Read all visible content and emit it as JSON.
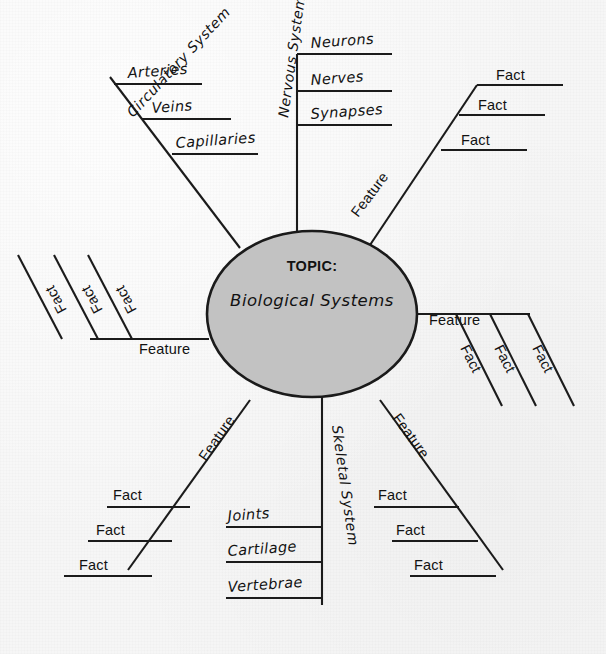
{
  "diagram": {
    "type": "mind-map",
    "title_label": "TOPIC:",
    "topic": "Biological Systems",
    "colors": {
      "background": "#f6f6f6",
      "center_fill": "#c2c2c2",
      "stroke": "#1b1b1b",
      "text": "#121212"
    },
    "center": {
      "cx": 312,
      "cy": 314,
      "rx": 105,
      "ry": 83
    },
    "branches": [
      {
        "id": "circulatory-system",
        "label": "Circulatory System",
        "position": "upper-left",
        "label_rotation": -47,
        "label_x": 133,
        "label_y": 118,
        "spine": "M 240,248 L 110,77",
        "children": [
          {
            "label": "Arteries",
            "style": "hand",
            "text_x": 128,
            "text_y": 78,
            "text_rotation": -4,
            "line": "M 114,84 L 202,84"
          },
          {
            "label": "Veins",
            "style": "hand",
            "text_x": 152,
            "text_y": 113,
            "text_rotation": -4,
            "line": "M 142,119 L 231,119"
          },
          {
            "label": "Capillaries",
            "style": "hand",
            "text_x": 176,
            "text_y": 148,
            "text_rotation": -4,
            "line": "M 172,154 L 258,154"
          }
        ]
      },
      {
        "id": "nervous-system",
        "label": "Nervous System",
        "position": "top",
        "label_rotation": -82,
        "label_x": 288,
        "label_y": 118,
        "spine": "M 297,232 L 297,54",
        "children": [
          {
            "label": "Neurons",
            "style": "hand",
            "text_x": 311,
            "text_y": 48,
            "text_rotation": -4,
            "line": "M 297,54 L 392,54"
          },
          {
            "label": "Nerves",
            "style": "hand",
            "text_x": 311,
            "text_y": 85,
            "text_rotation": -4,
            "line": "M 297,91 L 392,91"
          },
          {
            "label": "Synapses",
            "style": "hand",
            "text_x": 311,
            "text_y": 119,
            "text_rotation": -4,
            "line": "M 297,125 L 392,125"
          }
        ]
      },
      {
        "id": "feature-upper-right",
        "label": "Feature",
        "position": "upper-right",
        "label_rotation": -53,
        "label_x": 358,
        "label_y": 218,
        "spine": "M 370,245 L 477,85",
        "children": [
          {
            "label": "Fact",
            "style": "gen",
            "text_x": 496,
            "text_y": 80,
            "text_rotation": 0,
            "line": "M 477,85 L 563,85"
          },
          {
            "label": "Fact",
            "style": "gen",
            "text_x": 478,
            "text_y": 110,
            "text_rotation": 0,
            "line": "M 459,115 L 545,115"
          },
          {
            "label": "Fact",
            "style": "gen",
            "text_x": 461,
            "text_y": 145,
            "text_rotation": 0,
            "line": "M 441,150 L 527,150"
          }
        ]
      },
      {
        "id": "feature-right",
        "label": "Feature",
        "position": "right",
        "label_rotation": 0,
        "label_x": 429,
        "label_y": 325,
        "spine": "M 415,314 L 530,314",
        "children": [
          {
            "label": "Fact",
            "style": "gen",
            "text_x": 460,
            "text_y": 348,
            "text_rotation": 63,
            "line": "M 456,314 L 502,406"
          },
          {
            "label": "Fact",
            "style": "gen",
            "text_x": 494,
            "text_y": 348,
            "text_rotation": 63,
            "line": "M 490,314 L 536,406"
          },
          {
            "label": "Fact",
            "style": "gen",
            "text_x": 532,
            "text_y": 348,
            "text_rotation": 63,
            "line": "M 528,314 L 574,406"
          }
        ]
      },
      {
        "id": "skeletal-system",
        "label": "Skeletal System",
        "position": "bottom",
        "label_rotation": 82,
        "label_x": 332,
        "label_y": 426,
        "spine": "M 322,396 L 322,605",
        "children": [
          {
            "label": "Joints",
            "style": "hand",
            "text_x": 228,
            "text_y": 521,
            "text_rotation": -4,
            "line": "M 226,527 L 322,527"
          },
          {
            "label": "Cartilage",
            "style": "hand",
            "text_x": 228,
            "text_y": 556,
            "text_rotation": -4,
            "line": "M 226,562 L 322,562"
          },
          {
            "label": "Vertebrae",
            "style": "hand",
            "text_x": 228,
            "text_y": 592,
            "text_rotation": -4,
            "line": "M 226,598 L 322,598"
          }
        ]
      },
      {
        "id": "feature-lower-right",
        "label": "Feature",
        "position": "lower-right",
        "label_rotation": 54,
        "label_x": 392,
        "label_y": 418,
        "spine": "M 380,400 L 503,570",
        "children": [
          {
            "label": "Fact",
            "style": "gen",
            "text_x": 378,
            "text_y": 500,
            "text_rotation": 0,
            "line": "M 374,507 L 459,507"
          },
          {
            "label": "Fact",
            "style": "gen",
            "text_x": 396,
            "text_y": 535,
            "text_rotation": 0,
            "line": "M 392,541 L 478,541"
          },
          {
            "label": "Fact",
            "style": "gen",
            "text_x": 414,
            "text_y": 570,
            "text_rotation": 0,
            "line": "M 410,576 L 496,576"
          }
        ]
      },
      {
        "id": "feature-lower-left",
        "label": "Feature",
        "position": "lower-left",
        "label_rotation": -55,
        "label_x": 206,
        "label_y": 462,
        "spine": "M 250,400 L 128,570",
        "children": [
          {
            "label": "Fact",
            "style": "gen",
            "text_x": 113,
            "text_y": 500,
            "text_rotation": 0,
            "line": "M 107,507 L 190,507"
          },
          {
            "label": "Fact",
            "style": "gen",
            "text_x": 96,
            "text_y": 535,
            "text_rotation": 0,
            "line": "M 88,541 L 172,541"
          },
          {
            "label": "Fact",
            "style": "gen",
            "text_x": 79,
            "text_y": 570,
            "text_rotation": 0,
            "line": "M 64,576 L 152,576"
          }
        ]
      },
      {
        "id": "feature-left",
        "label": "Feature",
        "position": "left",
        "label_rotation": 0,
        "label_x": 139,
        "label_y": 354,
        "spine": "M 209,339 L 90,339",
        "children": [
          {
            "label": "Fact",
            "style": "gen",
            "text_x": 137,
            "text_y": 310,
            "text_rotation": -118,
            "line": "M 132,339 L 88,255"
          },
          {
            "label": "Fact",
            "style": "gen",
            "text_x": 103,
            "text_y": 310,
            "text_rotation": -118,
            "line": "M 98,339 L 54,255"
          },
          {
            "label": "Fact",
            "style": "gen",
            "text_x": 67,
            "text_y": 310,
            "text_rotation": -118,
            "line": "M 62,339 L 18,255"
          }
        ]
      }
    ]
  }
}
